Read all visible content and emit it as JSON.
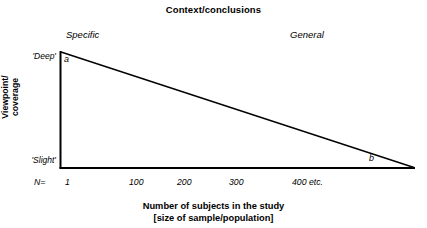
{
  "figure": {
    "title": "Context/conclusions",
    "background_color": "#ffffff",
    "line_color": "#000000"
  },
  "context_axis": {
    "left_label": "Specific",
    "right_label": "General"
  },
  "y_axis": {
    "title": "Viewpoint/\ncoverage",
    "ticks": [
      {
        "label": "'Deep'"
      },
      {
        "label": "'Slight'"
      }
    ]
  },
  "x_axis": {
    "title": "Number of subjects in the study\n[size of sample/population]",
    "prefix_label": "N=",
    "ticks": [
      {
        "label": "1",
        "x": 65
      },
      {
        "label": "100",
        "x": 129
      },
      {
        "label": "200",
        "x": 177
      },
      {
        "label": "300",
        "x": 229
      },
      {
        "label": "400 etc.",
        "x": 292
      }
    ]
  },
  "chart_data": {
    "type": "line",
    "title": "Context/conclusions",
    "xlabel": "Number of subjects in the study [size of sample/population]",
    "ylabel": "Viewpoint/coverage",
    "series": [
      {
        "name": "viewpoint-depth-vs-sample-size",
        "points": [
          {
            "label": "a",
            "x_label": "1",
            "y_label": "'Deep'"
          },
          {
            "label": "b",
            "x_label": "400 etc.",
            "y_label": "'Slight'"
          }
        ]
      }
    ],
    "annotations": [
      {
        "name": "apex-label",
        "text": "a"
      },
      {
        "name": "base-label",
        "text": "b"
      },
      {
        "name": "context-left",
        "text": "Specific"
      },
      {
        "name": "context-right",
        "text": "General"
      }
    ],
    "grid": false,
    "legend": "none"
  }
}
